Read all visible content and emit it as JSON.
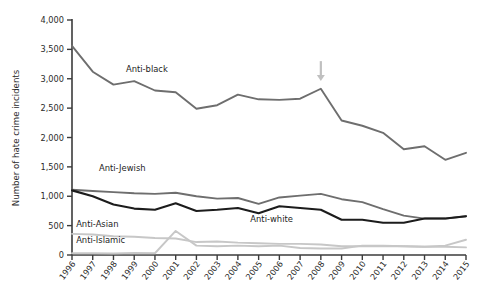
{
  "chart_data": {
    "type": "line",
    "title": "",
    "xlabel": "",
    "ylabel": "Number of hate crime incidents",
    "ylim": [
      0,
      4000
    ],
    "ytick_labels": [
      "0",
      "500",
      "1,000",
      "1,500",
      "2,000",
      "2,500",
      "3,000",
      "3,500",
      "4,000"
    ],
    "ytick_values": [
      0,
      500,
      1000,
      1500,
      2000,
      2500,
      3000,
      3500,
      4000
    ],
    "grid": false,
    "legend_position": "inline-labels",
    "x": [
      1996,
      1997,
      1998,
      1999,
      2000,
      2001,
      2002,
      2003,
      2004,
      2005,
      2006,
      2007,
      2008,
      2009,
      2010,
      2011,
      2012,
      2013,
      2014,
      2015
    ],
    "xtick_labels": [
      "1996",
      "1997",
      "1998",
      "1999",
      "2000",
      "2001",
      "2002",
      "2003",
      "2004",
      "2005",
      "2006",
      "2007",
      "2008",
      "2009",
      "2010",
      "2011",
      "2012",
      "2013",
      "2014",
      "2015"
    ],
    "series": [
      {
        "name": "Anti-black",
        "color": "#6e6e6e",
        "width": 1.9,
        "label_x": 1998.6,
        "label_y": 3120,
        "values": [
          3560,
          3120,
          2900,
          2960,
          2800,
          2770,
          2490,
          2550,
          2730,
          2650,
          2640,
          2660,
          2830,
          2290,
          2200,
          2080,
          1800,
          1850,
          1620,
          1740
        ]
      },
      {
        "name": "Anti-Jewish",
        "color": "#6e6e6e",
        "width": 1.9,
        "label_x": 1997.3,
        "label_y": 1430,
        "values": [
          1110,
          1090,
          1070,
          1050,
          1040,
          1060,
          1000,
          960,
          970,
          870,
          980,
          1010,
          1040,
          950,
          900,
          780,
          670,
          620,
          620,
          660
        ]
      },
      {
        "name": "Anti-white",
        "color": "#1c1c1c",
        "width": 2.1,
        "label_x": 2004.6,
        "label_y": 560,
        "values": [
          1100,
          1000,
          860,
          790,
          770,
          880,
          750,
          770,
          800,
          710,
          830,
          800,
          770,
          600,
          600,
          550,
          550,
          620,
          620,
          660
        ]
      },
      {
        "name": "Anti-Asian",
        "color": "#c7c7c7",
        "width": 1.9,
        "label_x": 1996.2,
        "label_y": 470,
        "values": [
          360,
          350,
          320,
          310,
          290,
          280,
          220,
          230,
          210,
          200,
          190,
          190,
          180,
          150,
          150,
          150,
          150,
          140,
          140,
          130
        ]
      },
      {
        "name": "Anti-Islamic",
        "color": "#c7c7c7",
        "width": 1.9,
        "label_x": 1996.2,
        "label_y": 205,
        "values": [
          30,
          30,
          25,
          35,
          30,
          410,
          160,
          150,
          160,
          150,
          160,
          120,
          110,
          110,
          160,
          160,
          150,
          140,
          160,
          260
        ]
      }
    ],
    "annotations": [
      {
        "name": "arrow-2008",
        "type": "arrow-down",
        "x": 2008,
        "y_top": 3300,
        "y_tip": 2960,
        "color": "#c0c0c0"
      }
    ]
  }
}
